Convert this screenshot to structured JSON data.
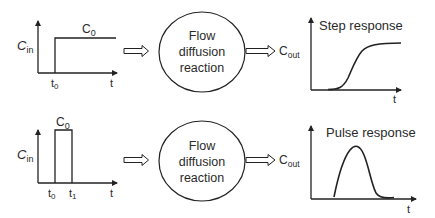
{
  "rows": [
    {
      "name": "step",
      "input": {
        "y_label_main": "C",
        "y_label_sub": "in",
        "level_label_main": "C",
        "level_label_sub": "0",
        "t0_main": "t",
        "t0_sub": "0",
        "x_label": "t"
      },
      "system": {
        "line1": "Flow",
        "line2": "diffusion",
        "line3": "reaction"
      },
      "output": {
        "label_main": "C",
        "label_sub": "out",
        "title": "Step response",
        "x_label": "t"
      }
    },
    {
      "name": "pulse",
      "input": {
        "y_label_main": "C",
        "y_label_sub": "in",
        "level_label_main": "C",
        "level_label_sub": "0",
        "t0_main": "t",
        "t0_sub": "0",
        "t1_main": "t",
        "t1_sub": "1",
        "x_label": "t"
      },
      "system": {
        "line1": "Flow",
        "line2": "diffusion",
        "line3": "reaction"
      },
      "output": {
        "label_main": "C",
        "label_sub": "out",
        "title": "Pulse response",
        "x_label": "t"
      }
    }
  ],
  "colors": {
    "stroke": "#222222",
    "text": "#2a2a2a",
    "background": "#ffffff"
  }
}
